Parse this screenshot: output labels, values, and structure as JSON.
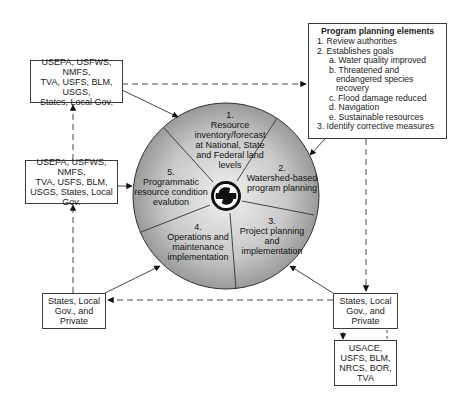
{
  "program_planning": {
    "title": "Program planning elements",
    "items": [
      "1. Review authorities",
      "2. Establishes goals",
      "a. Water quality improved",
      "b. Threatened and endangered species recovery",
      "c. Flood damage reduced",
      "d. Navigation",
      "e. Sustainable resources",
      "3. Identify corrective measures"
    ]
  },
  "boxes": {
    "top_left": [
      "USEPA, USFWS, NMFS,",
      "TVA, USFS, BLM, USGS,",
      "States, Local Gov."
    ],
    "mid_left": [
      "USEPA, USFWS, NMFS,",
      "TVA, USFS, BLM,",
      "USGS, States, Local Gov."
    ],
    "bottom_left": [
      "States, Local",
      "Gov., and",
      "Private"
    ],
    "bottom_right": [
      "States, Local",
      "Gov., and",
      "Private"
    ],
    "federal": [
      "USACE,",
      "USFS, BLM,",
      "NRCS, BOR,",
      "TVA"
    ]
  },
  "cycle": {
    "segments": [
      {
        "num": "1.",
        "lines": [
          "Resource",
          "inventory/forecast",
          "at National, State",
          "and Federal land",
          "levels"
        ]
      },
      {
        "num": "2.",
        "lines": [
          "Watershed-based",
          "program planning"
        ]
      },
      {
        "num": "3.",
        "lines": [
          "Project planning",
          "and",
          "implementation"
        ]
      },
      {
        "num": "4.",
        "lines": [
          "Operations and",
          "maintenance",
          "implementation"
        ]
      },
      {
        "num": "5.",
        "lines": [
          "Programmatic",
          "resource condition",
          "evalution"
        ]
      }
    ],
    "center_icon": "cycle-arrows-icon"
  },
  "colors": {
    "line": "#3a3a3a",
    "circle_light": "#e6e6e6",
    "circle_dark": "#8a8a8a"
  }
}
